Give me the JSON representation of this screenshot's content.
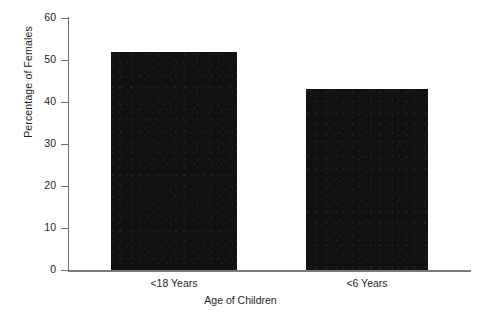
{
  "chart_data": {
    "type": "bar",
    "title": "",
    "xlabel": "Age of Children",
    "ylabel": "Percentage of Females",
    "categories": [
      "<18 Years",
      "<6 Years"
    ],
    "values": [
      52,
      43
    ],
    "series": [
      {
        "name": "Percentage of Females",
        "values": [
          52,
          43
        ]
      }
    ],
    "ylim": [
      0,
      60
    ],
    "yticks": [
      0,
      10,
      20,
      30,
      40,
      50,
      60
    ],
    "ytick_labels": [
      "0",
      "10",
      "20",
      "30",
      "40",
      "50",
      "60"
    ],
    "grid": false,
    "legend": false,
    "legend_position": "none",
    "bar_color": "#111111",
    "axis_color": "#6e6e6e",
    "background_color": "#ffffff",
    "annotations": []
  }
}
